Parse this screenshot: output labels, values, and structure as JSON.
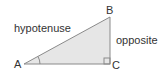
{
  "diagram": {
    "type": "right-triangle",
    "vertices": {
      "A": {
        "label": "A"
      },
      "B": {
        "label": "B"
      },
      "C": {
        "label": "C"
      }
    },
    "sides": {
      "hypotenuse": {
        "label": "hypotenuse",
        "from": "A",
        "to": "B"
      },
      "opposite": {
        "label": "opposite",
        "from": "B",
        "to": "C"
      }
    },
    "right_angle_at": "C",
    "marked_angle_at": "A",
    "colors": {
      "fill": "#e6e6e6",
      "stroke": "#8a8a8a",
      "text": "#333333"
    }
  }
}
